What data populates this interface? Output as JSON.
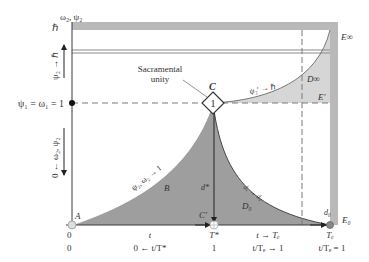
{
  "colors": {
    "band": "#b9b9b9",
    "fill_dark": "#9e9e9e",
    "fill_light": "#d6d6d6",
    "line": "#3a3a3a",
    "dashed": "#7a7a7a",
    "text": "#333333"
  },
  "y_axis": {
    "title": "ω₂, ψ₂",
    "top_label": "ℏ",
    "level_label": "ψ₁ = ω₁ = 1",
    "up_arrow_label": "ψ₂ → ℏ",
    "down_arrow_label": "0 ← ω₂, ψ₂"
  },
  "x_axis": {
    "row1": {
      "origin": "0",
      "t": "t",
      "t_star": "T*",
      "t_to_T": "t → Tₑ",
      "T": "Tₑ"
    },
    "row2": {
      "origin": "0",
      "ratio_zero": "0 ← t/T*",
      "one": "1",
      "ratio_to_one": "t/Tₑ → 1",
      "ratio_eq_one": "t/Tₑ = 1"
    }
  },
  "annotations": {
    "sacramental": "Sacramental",
    "unity": "unity",
    "point_C": "C",
    "diamond_value": "1",
    "point_A": "A",
    "point_C_prime": "C′",
    "point_E_inf": "E∞",
    "point_E_prime": "E′",
    "point_E_zero": "E₀",
    "region_B": "B",
    "region_D_inf": "D∞",
    "region_D_zero": "D₀",
    "curve_psi_omega": "ψ₂, ω₂ → 1",
    "curve_psi_h": "ψ₂′ → ℏ",
    "curve_d": "dₓ → d₀",
    "d_star": "d*",
    "d_zero": "d₀"
  }
}
